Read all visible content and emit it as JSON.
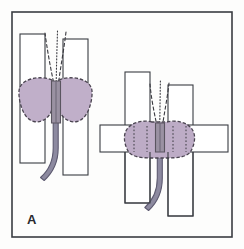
{
  "figure": {
    "panel_label": "A",
    "caption_text": "",
    "background_color": "#fdfdfc",
    "frame": {
      "name": "figure-border",
      "color": "#3a3d42",
      "stroke_width": 1.6,
      "x": 12,
      "y": 12,
      "width": 220,
      "height": 225
    }
  },
  "colors": {
    "gland_fill": "#b9a8c4",
    "gland_fill_light": "#c6b6cf",
    "gland_outline": "#4a4450",
    "core_band_fill": "#8f8796",
    "core_band_outline": "#5a5560",
    "stem_fill": "#8d8aa0",
    "stem_outline": "#5d5a70",
    "rect_fill": "#ffffff",
    "rect_outline": "#3a3d42",
    "trace_color": "#3a3a40",
    "label_color": "#2a2a2e"
  },
  "views": [
    {
      "id": "left-view",
      "name": "coronal-view",
      "label": "",
      "rectangles": [
        {
          "name": "plane-rect-left",
          "x": 20,
          "y": 34,
          "width": 25,
          "height": 129
        },
        {
          "name": "plane-rect-right",
          "x": 63,
          "y": 39,
          "width": 25,
          "height": 136
        }
      ],
      "gland": {
        "name": "gland-outline-left",
        "fill": "#b9a8c4",
        "cx": 55,
        "cy": 100,
        "half_width": 37,
        "half_height": 22
      },
      "core_band": {
        "name": "core-band-left",
        "x": 51,
        "y": 82,
        "width": 10,
        "height": 42
      },
      "stem": {
        "name": "stem-left",
        "description": "curved tubular stem descending and curving left",
        "top_x": 56,
        "top_y": 118,
        "bottom_x": 40,
        "bottom_y": 178,
        "width": 5
      },
      "traces": [
        {
          "name": "trace-dashed-left",
          "style": "dashed",
          "x1": 45,
          "y1": 33,
          "x2": 54,
          "y2": 83
        },
        {
          "name": "trace-dotted-center",
          "style": "dotted",
          "x1": 57,
          "y1": 31,
          "x2": 56,
          "y2": 83
        },
        {
          "name": "trace-dashed-right",
          "style": "dashed",
          "x1": 66,
          "y1": 32,
          "x2": 58,
          "y2": 83
        }
      ]
    },
    {
      "id": "right-view",
      "name": "sagittal-view",
      "label": "",
      "rectangles": [
        {
          "name": "plane-rect-left",
          "x": 125,
          "y": 72,
          "width": 25,
          "height": 131
        },
        {
          "name": "plane-rect-right",
          "x": 168,
          "y": 85,
          "width": 25,
          "height": 131
        },
        {
          "name": "plane-rect-horizontal",
          "x": 100,
          "y": 125,
          "width": 128,
          "height": 27
        }
      ],
      "gland": {
        "name": "gland-outline-right",
        "fill": "#b9a8c4",
        "cx": 159,
        "cy": 138,
        "half_width": 36,
        "half_height": 17
      },
      "core_band": {
        "name": "core-band-right",
        "x": 155,
        "y": 124,
        "width": 9,
        "height": 30
      },
      "stem": {
        "name": "stem-right",
        "description": "curved tubular stem descending and curving left",
        "top_x": 160,
        "top_y": 148,
        "bottom_x": 145,
        "bottom_y": 208,
        "width": 5
      },
      "traces": [
        {
          "name": "trace-dashed-left",
          "style": "dashed",
          "x1": 150,
          "y1": 84,
          "x2": 157,
          "y2": 126
        },
        {
          "name": "trace-dotted-center",
          "style": "dotted",
          "x1": 160,
          "y1": 81,
          "x2": 160,
          "y2": 126
        },
        {
          "name": "trace-dashed-right",
          "style": "dashed",
          "x1": 169,
          "y1": 83,
          "x2": 162,
          "y2": 126
        }
      ],
      "vertical_guides": [
        {
          "name": "guide-1",
          "x": 134
        },
        {
          "name": "guide-2",
          "x": 147
        },
        {
          "name": "guide-3",
          "x": 160
        },
        {
          "name": "guide-4",
          "x": 173
        },
        {
          "name": "guide-5",
          "x": 186
        }
      ]
    }
  ]
}
